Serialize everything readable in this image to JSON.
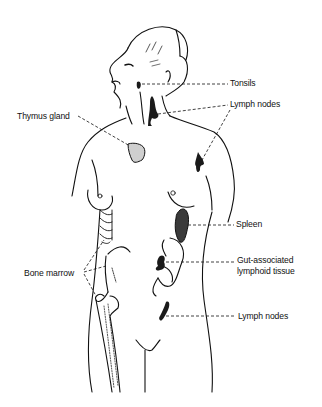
{
  "diagram": {
    "labels": {
      "tonsils": "Tonsils",
      "lymph_nodes_upper": "Lymph nodes",
      "thymus_gland": "Thymus gland",
      "spleen": "Spleen",
      "gut_line1": "Gut-associated",
      "gut_line2": "lymphoid tissue",
      "bone_marrow": "Bone marrow",
      "lymph_nodes_lower": "Lymph nodes"
    },
    "colors": {
      "ink": "#111111",
      "organ_fill": "#2a2a2a",
      "spleen_fill": "#3a3a3a",
      "background": "#ffffff"
    }
  }
}
